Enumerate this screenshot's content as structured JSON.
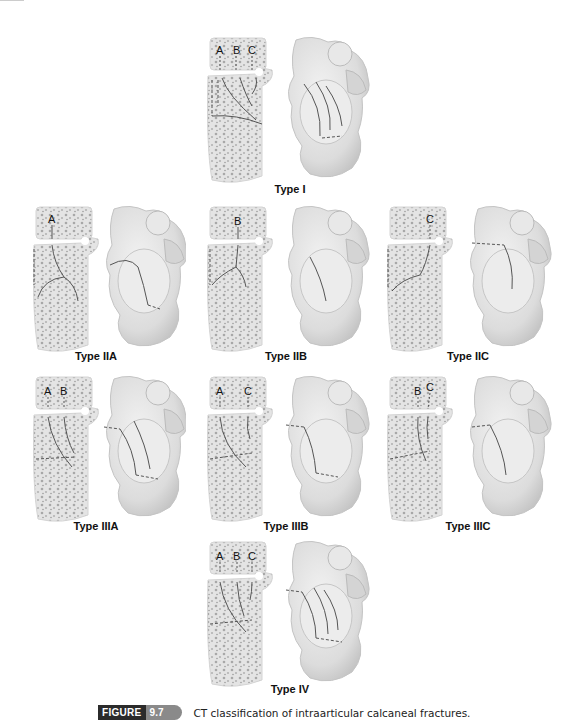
{
  "figure": {
    "tag": "FIGURE",
    "number": "9.7",
    "caption": "CT classification of intraarticular calcaneal fractures.",
    "colors": {
      "tag_bg": "#2b2b2b",
      "number_bg": "#8a8a8a",
      "bone_fill": "#e6e6e6",
      "bone_texture": "#9a9a9a",
      "fracture_line": "#555555"
    }
  },
  "panels": [
    {
      "id": "type-i",
      "label": "Type I",
      "letters": [
        "A",
        "B",
        "C"
      ]
    },
    {
      "id": "type-iia",
      "label": "Type IIA",
      "letters": [
        "A"
      ]
    },
    {
      "id": "type-iib",
      "label": "Type IIB",
      "letters": [
        "B"
      ]
    },
    {
      "id": "type-iic",
      "label": "Type IIC",
      "letters": [
        "C"
      ]
    },
    {
      "id": "type-iiia",
      "label": "Type IIIA",
      "letters": [
        "A",
        "B"
      ]
    },
    {
      "id": "type-iiib",
      "label": "Type IIIB",
      "letters": [
        "A",
        "C"
      ]
    },
    {
      "id": "type-iiic",
      "label": "Type IIIC",
      "letters": [
        "B",
        "C"
      ]
    },
    {
      "id": "type-iv",
      "label": "Type IV",
      "letters": [
        "A",
        "B",
        "C"
      ]
    }
  ]
}
